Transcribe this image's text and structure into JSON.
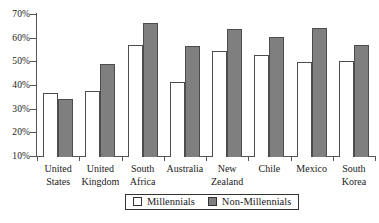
{
  "chart_data": {
    "type": "bar",
    "title": "",
    "subtitle": "",
    "xlabel": "",
    "ylabel": "",
    "ylim": [
      10,
      70
    ],
    "yticks": [
      "10%",
      "20%",
      "30%",
      "40%",
      "50%",
      "60%",
      "70%"
    ],
    "grid": false,
    "legend_position": "bottom-center",
    "categories": [
      "United States",
      "United Kingdom",
      "South Africa",
      "Australia",
      "New Zealand",
      "Chile",
      "Mexico",
      "South Korea"
    ],
    "series": [
      {
        "name": "Millennials",
        "color": "#ffffff",
        "values": [
          37,
          38,
          57.5,
          41.5,
          55,
          53,
          50,
          50.5
        ]
      },
      {
        "name": "Non-Millennials",
        "color": "#7f7f7f",
        "values": [
          34.5,
          49.5,
          66.5,
          57,
          64,
          60.5,
          64.5,
          57.5
        ]
      }
    ]
  },
  "legend": {
    "entries": [
      {
        "label": "Millennials"
      },
      {
        "label": "Non-Millennials"
      }
    ]
  },
  "colors": {
    "millennials_fill": "#ffffff",
    "non_millennials_fill": "#7f7f7f",
    "axis": "#555555",
    "bar_outline": "#4d4d4d",
    "background": "#ffffff"
  }
}
